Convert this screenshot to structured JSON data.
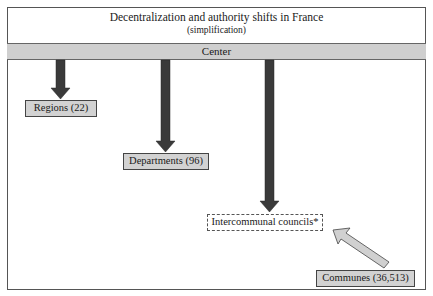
{
  "diagram": {
    "title": "Decentralization and authority shifts in France",
    "subtitle": "(simplification)",
    "center_label": "Center",
    "nodes": [
      {
        "id": "regions",
        "label": "Regions (22)",
        "style": "solid"
      },
      {
        "id": "departments",
        "label": "Departments (96)",
        "style": "solid"
      },
      {
        "id": "intercommunal",
        "label": "Intercommunal councils*",
        "style": "dashed"
      },
      {
        "id": "communes",
        "label": "Communes (36,513)",
        "style": "solid"
      }
    ],
    "edges": [
      {
        "from": "center",
        "to": "regions",
        "style": "dark"
      },
      {
        "from": "center",
        "to": "departments",
        "style": "dark"
      },
      {
        "from": "center",
        "to": "intercommunal",
        "style": "dark"
      },
      {
        "from": "communes",
        "to": "intercommunal",
        "style": "light"
      }
    ],
    "colors": {
      "band": "#cfcfcf",
      "node_fill": "#d2d2d2",
      "dark_arrow": "#3a3a3a",
      "light_arrow": "#d0d0d0",
      "border": "#444444"
    }
  }
}
